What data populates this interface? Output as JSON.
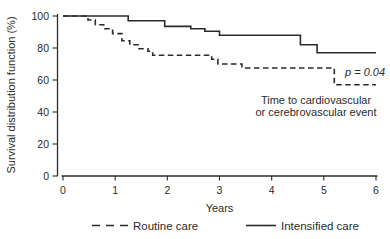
{
  "figure": {
    "kind": "Kaplan-Meier survival plot"
  },
  "chart_data": {
    "type": "line",
    "subtype": "step-survival",
    "title": "",
    "xlabel": "Years",
    "ylabel": "Survival distribution function (%)",
    "xlim": [
      0,
      6
    ],
    "ylim": [
      0,
      100
    ],
    "xticks": [
      0,
      1,
      2,
      3,
      4,
      5,
      6
    ],
    "yticks": [
      0,
      20,
      40,
      60,
      80,
      100
    ],
    "grid": false,
    "legend_position": "bottom-center",
    "line_color": "#2b2b2b",
    "annotations": {
      "p_value": "p = 0.04",
      "note_line1": "Time to cardiovascular",
      "note_line2": "or cerebrovascular event"
    },
    "series": [
      {
        "name": "Routine care",
        "line_style": "dashed",
        "steps": [
          [
            0,
            100
          ],
          [
            0.48,
            97.5
          ],
          [
            0.62,
            94.5
          ],
          [
            0.78,
            92
          ],
          [
            0.95,
            89
          ],
          [
            1.13,
            84.5
          ],
          [
            1.28,
            82
          ],
          [
            1.44,
            79.5
          ],
          [
            1.63,
            78
          ],
          [
            1.72,
            75.5
          ],
          [
            2.85,
            73
          ],
          [
            2.97,
            70
          ],
          [
            3.43,
            67.5
          ],
          [
            5.2,
            57
          ]
        ],
        "end_x": 6
      },
      {
        "name": "Intensified care",
        "line_style": "solid",
        "steps": [
          [
            0,
            100
          ],
          [
            1.25,
            97
          ],
          [
            1.95,
            93.5
          ],
          [
            2.45,
            92
          ],
          [
            2.72,
            90.5
          ],
          [
            3.0,
            88
          ],
          [
            4.55,
            82
          ],
          [
            4.87,
            77
          ]
        ],
        "end_x": 6
      }
    ]
  }
}
